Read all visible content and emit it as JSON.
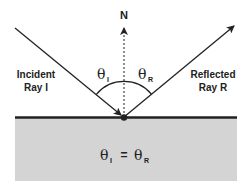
{
  "colors": {
    "background": "#ffffff",
    "medium": "#d4d4d4",
    "ink": "#222222"
  },
  "labels": {
    "normal": "N",
    "incident_line1": "Incident",
    "incident_line2": "Ray I",
    "reflected_line1": "Reflected",
    "reflected_line2": "Ray R",
    "theta": "θ",
    "incident_sub": "I",
    "reflected_sub": "R",
    "equation_lhs_sub": "I",
    "equation_equals": "=",
    "equation_rhs_sub": "R"
  },
  "elements": {
    "normal_line": "dashed",
    "incident_ray": "solid-arrow-toward-surface",
    "reflected_ray": "solid-arrow-away-from-surface",
    "angle_arc": "arc spanning incident to reflected ray",
    "point_of_incidence": "filled dot"
  }
}
